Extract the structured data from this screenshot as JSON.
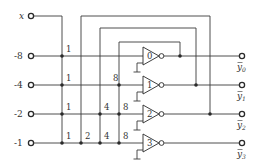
{
  "diagram": {
    "input_x": {
      "label": "x",
      "y": 16
    },
    "inputs": [
      {
        "label": "-8",
        "y": 56
      },
      {
        "label": "-4",
        "y": 85
      },
      {
        "label": "-2",
        "y": 114
      },
      {
        "label": "-1",
        "y": 143
      }
    ],
    "columns": [
      {
        "weight": "1",
        "x": 62
      },
      {
        "weight": "2",
        "x": 81
      },
      {
        "weight": "4",
        "x": 100
      },
      {
        "weight": "8",
        "x": 119
      }
    ],
    "junction_weights": [
      {
        "row": 0,
        "labels": [
          "1"
        ]
      },
      {
        "row": 1,
        "labels": [
          "1",
          "8"
        ]
      },
      {
        "row": 2,
        "labels": [
          "1",
          "4",
          "8"
        ]
      },
      {
        "row": 3,
        "labels": [
          "1",
          "2",
          "4",
          "8"
        ]
      }
    ],
    "gates": [
      {
        "label": "0"
      },
      {
        "label": "1"
      },
      {
        "label": "2"
      },
      {
        "label": "3"
      }
    ],
    "outputs": [
      {
        "label": "y",
        "sub": "0"
      },
      {
        "label": "y",
        "sub": "1"
      },
      {
        "label": "y",
        "sub": "2"
      },
      {
        "label": "y",
        "sub": "3"
      }
    ]
  }
}
